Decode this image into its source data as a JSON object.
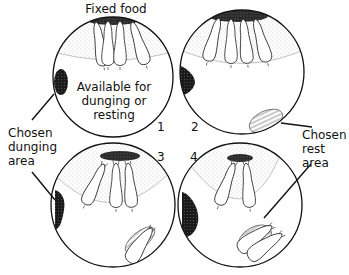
{
  "diagram": {
    "title_label": "Fixed food",
    "available_label": [
      "Available for",
      "dunging or",
      "resting"
    ],
    "dunging_label": [
      "Chosen",
      "dunging",
      "area"
    ],
    "rest_label": [
      "Chosen",
      "rest",
      "area"
    ],
    "stages": [
      {
        "number": "1"
      },
      {
        "number": "2"
      },
      {
        "number": "3"
      },
      {
        "number": "4"
      }
    ]
  }
}
